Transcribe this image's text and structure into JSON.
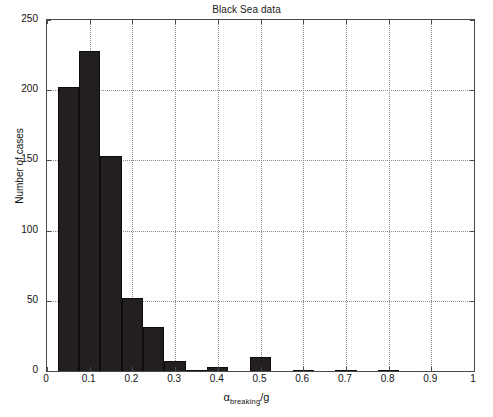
{
  "chart_data": {
    "type": "bar",
    "title": "Black Sea data",
    "xlabel": "α_breaking/g",
    "xlabel_parts": {
      "symbol": "α",
      "subscript": "breaking",
      "suffix": "/g"
    },
    "ylabel": "Number of cases",
    "xlim": [
      0,
      1
    ],
    "ylim": [
      0,
      250
    ],
    "grid": true,
    "legend": null,
    "bin_width": 0.05,
    "bin_starts": [
      0.025,
      0.075,
      0.125,
      0.175,
      0.225,
      0.275,
      0.325,
      0.375,
      0.425,
      0.475,
      0.525,
      0.575,
      0.625,
      0.675,
      0.725,
      0.775,
      0.825,
      0.875,
      0.925,
      0.975
    ],
    "categories": [
      "0.05",
      "0.10",
      "0.15",
      "0.20",
      "0.25",
      "0.30",
      "0.35",
      "0.40",
      "0.45",
      "0.50",
      "0.55",
      "0.60",
      "0.65",
      "0.70",
      "0.75",
      "0.80",
      "0.85",
      "0.90",
      "0.95",
      "1.00"
    ],
    "values": [
      202,
      228,
      153,
      52,
      31,
      7,
      1,
      3,
      0,
      10,
      0,
      1,
      0,
      1,
      0,
      1,
      0,
      0,
      0,
      0
    ],
    "xticks": [
      0,
      0.1,
      0.2,
      0.3,
      0.4,
      0.5,
      0.6,
      0.7,
      0.8,
      0.9,
      1
    ],
    "xticklabels": [
      "0",
      "0.1",
      "0.2",
      "0.3",
      "0.4",
      "0.5",
      "0.6",
      "0.7",
      "0.8",
      "0.9",
      "1"
    ],
    "yticks": [
      0,
      50,
      100,
      150,
      200,
      250
    ],
    "yticklabels": [
      "0",
      "50",
      "100",
      "150",
      "200",
      "250"
    ],
    "bar_color": "#231f20",
    "grid_color": "#8c8c8c",
    "axis_color": "#4a4a4a",
    "background": "#ffffff"
  }
}
